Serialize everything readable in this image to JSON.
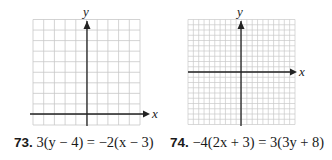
{
  "problems": [
    {
      "number": "73.",
      "equation": "3(y − 4) = −2(x − 3)",
      "graph": {
        "x_label": "x",
        "y_label": "y",
        "columns": 10,
        "rows": 10,
        "origin_col": 5,
        "origin_row": 9
      }
    },
    {
      "number": "74.",
      "equation": "−4(2x + 3) = 3(3y + 8)",
      "graph": {
        "x_label": "x",
        "y_label": "y",
        "columns": 20,
        "rows": 20,
        "origin_col": 10,
        "origin_row": 10
      }
    }
  ],
  "colors": {
    "grid": "#c8c8c8",
    "axis": "#222222",
    "text": "#1a1a1a"
  }
}
